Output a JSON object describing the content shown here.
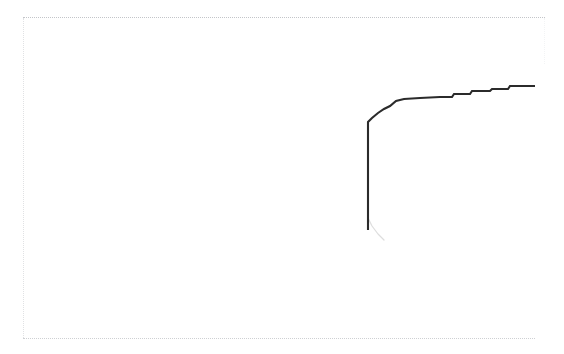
{
  "figure": {
    "title": "",
    "background_color": "#ffffff",
    "frame_color": "#b9bcc0",
    "curve_color": "#2b2b2b",
    "annotation_smudge": "",
    "axis_label_smudge": ""
  },
  "plot_area": {
    "left_px": 23,
    "top_px": 17,
    "right_px": 545,
    "bottom_px": 338
  },
  "chart_data": {
    "type": "line",
    "title": "",
    "subtitle": "",
    "xlabel": "",
    "ylabel": "",
    "legend": [],
    "legend_position": "none",
    "grid": false,
    "axis_tick_labels_visible": false,
    "xlim": [
      0,
      564
    ],
    "ylim": [
      354,
      0
    ],
    "note": "Degraded scan: axis ticks and labels are not legible. Coordinates are read directly off the image in pixel space (y inverted, origin top-left).",
    "series": [
      {
        "name": "step-curve",
        "style": "step-post",
        "color": "#2b2b2b",
        "points": [
          [
            368,
            230
          ],
          [
            368,
            218
          ],
          [
            368,
            160
          ],
          [
            368,
            122
          ],
          [
            372,
            118
          ],
          [
            378,
            113
          ],
          [
            384,
            109
          ],
          [
            390,
            106
          ],
          [
            396,
            101
          ],
          [
            404,
            99
          ],
          [
            420,
            98
          ],
          [
            440,
            97
          ],
          [
            452,
            97
          ],
          [
            454,
            94
          ],
          [
            470,
            94
          ],
          [
            472,
            91
          ],
          [
            490,
            91
          ],
          [
            492,
            89
          ],
          [
            508,
            89
          ],
          [
            510,
            86
          ],
          [
            535,
            86
          ]
        ],
        "faint_tail_points": [
          [
            368,
            218
          ],
          [
            372,
            226
          ],
          [
            378,
            234
          ],
          [
            384,
            240
          ]
        ]
      }
    ]
  }
}
